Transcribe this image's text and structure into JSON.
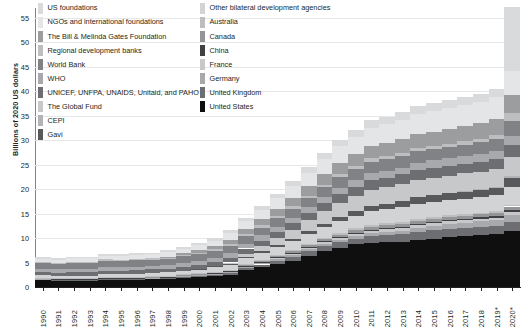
{
  "axis": {
    "ylabel": "Billions of 2020 US dollars",
    "yticks": [
      "0",
      "5",
      "10",
      "15",
      "20",
      "25",
      "30",
      "35",
      "40",
      "45",
      "50",
      "55"
    ],
    "xticks": [
      "1990",
      "1991",
      "1992",
      "1993",
      "1994",
      "1995",
      "1996",
      "1997",
      "1998",
      "1999",
      "2000",
      "2001",
      "2002",
      "2003",
      "2004",
      "2005",
      "2006",
      "2007",
      "2008",
      "2009",
      "2010",
      "2011",
      "2012",
      "2013",
      "2014",
      "2015",
      "2016",
      "2017",
      "2018",
      "2019*",
      "2020*"
    ]
  },
  "legend": {
    "left": [
      {
        "label": "US foundations",
        "color": "#d9dadb"
      },
      {
        "label": "NGOs and international foundations",
        "color": "#e4e5e6"
      },
      {
        "label": "The Bill & Melinda Gates Foundation",
        "color": "#9b9d9f"
      },
      {
        "label": "Regional development banks",
        "color": "#bcbec0"
      },
      {
        "label": "World Bank",
        "color": "#808285"
      },
      {
        "label": "WHO",
        "color": "#a7a9ac"
      },
      {
        "label": "UNICEF, UNFPA, UNAIDS, Unitaid, and PAHO",
        "color": "#6d6e71"
      },
      {
        "label": "The Global Fund",
        "color": "#c7c8ca"
      },
      {
        "label": "CEPI",
        "color": "#b1b3b6"
      },
      {
        "label": "Gavi",
        "color": "#58595b"
      }
    ],
    "right": [
      {
        "label": "Other bilateral development agencies",
        "color": "#d1d3d4"
      },
      {
        "label": "Australia",
        "color": "#bcbec0"
      },
      {
        "label": "Canada",
        "color": "#939598"
      },
      {
        "label": "China",
        "color": "#414042"
      },
      {
        "label": "France",
        "color": "#c7c8ca"
      },
      {
        "label": "Germany",
        "color": "#a7a9ac"
      },
      {
        "label": "United Kingdom",
        "color": "#6d6e71"
      },
      {
        "label": "United States",
        "color": "#0f0f0f"
      }
    ]
  },
  "chart_data": {
    "type": "area",
    "subtype": "stacked-column",
    "title": "",
    "xlabel": "",
    "ylabel": "Billions of 2020 US dollars",
    "ylim": [
      0,
      57
    ],
    "grid": true,
    "legend_position": "top",
    "categories": [
      "1990",
      "1991",
      "1992",
      "1993",
      "1994",
      "1995",
      "1996",
      "1997",
      "1998",
      "1999",
      "2000",
      "2001",
      "2002",
      "2003",
      "2004",
      "2005",
      "2006",
      "2007",
      "2008",
      "2009",
      "2010",
      "2011",
      "2012",
      "2013",
      "2014",
      "2015",
      "2016",
      "2017",
      "2018",
      "2019*",
      "2020*"
    ],
    "series": [
      {
        "name": "United States",
        "color": "#0f0f0f",
        "values": [
          1.4,
          1.3,
          1.3,
          1.3,
          1.5,
          1.5,
          1.5,
          1.6,
          1.6,
          1.8,
          2.0,
          2.2,
          2.5,
          3.4,
          4.0,
          4.7,
          5.4,
          6.4,
          7.3,
          8.0,
          8.7,
          9.0,
          9.1,
          9.2,
          9.6,
          9.9,
          10.2,
          10.4,
          10.6,
          10.8,
          11.5
        ]
      },
      {
        "name": "United Kingdom",
        "color": "#6d6e71",
        "values": [
          0.15,
          0.15,
          0.15,
          0.15,
          0.2,
          0.2,
          0.2,
          0.2,
          0.25,
          0.3,
          0.3,
          0.35,
          0.4,
          0.5,
          0.6,
          0.7,
          0.8,
          0.9,
          1.0,
          1.1,
          1.2,
          1.4,
          1.5,
          1.6,
          1.7,
          1.7,
          1.7,
          1.6,
          1.6,
          1.6,
          1.7
        ]
      },
      {
        "name": "Germany",
        "color": "#a7a9ac",
        "values": [
          0.1,
          0.1,
          0.1,
          0.1,
          0.1,
          0.1,
          0.12,
          0.12,
          0.12,
          0.15,
          0.15,
          0.15,
          0.18,
          0.2,
          0.25,
          0.3,
          0.35,
          0.4,
          0.45,
          0.5,
          0.55,
          0.6,
          0.65,
          0.7,
          0.8,
          0.9,
          1.0,
          1.1,
          1.2,
          1.3,
          1.6
        ]
      },
      {
        "name": "France",
        "color": "#c7c8ca",
        "values": [
          0.1,
          0.1,
          0.1,
          0.1,
          0.1,
          0.1,
          0.1,
          0.1,
          0.1,
          0.12,
          0.12,
          0.15,
          0.18,
          0.2,
          0.25,
          0.3,
          0.35,
          0.4,
          0.45,
          0.5,
          0.5,
          0.55,
          0.55,
          0.55,
          0.55,
          0.5,
          0.5,
          0.5,
          0.5,
          0.5,
          0.55
        ]
      },
      {
        "name": "China",
        "color": "#414042",
        "values": [
          0.02,
          0.02,
          0.02,
          0.02,
          0.02,
          0.02,
          0.02,
          0.02,
          0.03,
          0.03,
          0.03,
          0.04,
          0.04,
          0.05,
          0.06,
          0.07,
          0.08,
          0.09,
          0.1,
          0.12,
          0.14,
          0.16,
          0.18,
          0.2,
          0.22,
          0.25,
          0.28,
          0.3,
          0.32,
          0.35,
          0.4
        ]
      },
      {
        "name": "Canada",
        "color": "#939598",
        "values": [
          0.08,
          0.08,
          0.08,
          0.08,
          0.09,
          0.09,
          0.09,
          0.1,
          0.1,
          0.12,
          0.12,
          0.14,
          0.16,
          0.2,
          0.25,
          0.3,
          0.35,
          0.4,
          0.45,
          0.5,
          0.55,
          0.6,
          0.6,
          0.6,
          0.6,
          0.6,
          0.6,
          0.6,
          0.6,
          0.6,
          0.7
        ]
      },
      {
        "name": "Australia",
        "color": "#bcbec0",
        "values": [
          0.05,
          0.05,
          0.05,
          0.05,
          0.05,
          0.06,
          0.06,
          0.06,
          0.07,
          0.07,
          0.08,
          0.09,
          0.1,
          0.12,
          0.14,
          0.16,
          0.18,
          0.2,
          0.25,
          0.3,
          0.35,
          0.4,
          0.42,
          0.45,
          0.45,
          0.42,
          0.4,
          0.38,
          0.36,
          0.35,
          0.4
        ]
      },
      {
        "name": "Other bilateral development agencies",
        "color": "#d1d3d4",
        "values": [
          0.5,
          0.5,
          0.55,
          0.55,
          0.6,
          0.6,
          0.65,
          0.65,
          0.7,
          0.75,
          0.8,
          0.9,
          1.0,
          1.2,
          1.4,
          1.6,
          1.8,
          2.0,
          2.2,
          2.4,
          2.6,
          2.8,
          2.9,
          3.0,
          3.1,
          3.1,
          3.1,
          3.2,
          3.2,
          3.3,
          3.6
        ]
      },
      {
        "name": "Gavi",
        "color": "#58595b",
        "values": [
          0,
          0,
          0,
          0,
          0,
          0,
          0,
          0,
          0,
          0,
          0.1,
          0.2,
          0.25,
          0.3,
          0.35,
          0.4,
          0.5,
          0.6,
          0.7,
          0.8,
          0.9,
          1.0,
          1.1,
          1.2,
          1.3,
          1.4,
          1.4,
          1.5,
          1.5,
          1.6,
          1.8
        ]
      },
      {
        "name": "CEPI",
        "color": "#b1b3b6",
        "values": [
          0,
          0,
          0,
          0,
          0,
          0,
          0,
          0,
          0,
          0,
          0,
          0,
          0,
          0,
          0,
          0,
          0,
          0,
          0,
          0,
          0,
          0,
          0,
          0,
          0,
          0,
          0,
          0.05,
          0.08,
          0.1,
          0.5
        ]
      },
      {
        "name": "The Global Fund",
        "color": "#c7c8ca",
        "values": [
          0,
          0,
          0,
          0,
          0,
          0,
          0,
          0,
          0,
          0,
          0,
          0,
          0.2,
          0.6,
          1.0,
          1.4,
          1.8,
          2.2,
          2.6,
          3.0,
          3.2,
          3.4,
          3.4,
          3.5,
          3.6,
          3.6,
          3.6,
          3.6,
          3.6,
          3.6,
          3.8
        ]
      },
      {
        "name": "UNICEF, UNFPA, UNAIDS, Unitaid, and PAHO",
        "color": "#6d6e71",
        "values": [
          0.6,
          0.6,
          0.65,
          0.65,
          0.7,
          0.7,
          0.7,
          0.75,
          0.75,
          0.8,
          0.85,
          0.9,
          1.0,
          1.1,
          1.2,
          1.3,
          1.4,
          1.5,
          1.6,
          1.7,
          1.8,
          1.9,
          1.9,
          2.0,
          2.0,
          2.0,
          2.0,
          2.0,
          2.0,
          2.1,
          2.4
        ]
      },
      {
        "name": "WHO",
        "color": "#a7a9ac",
        "values": [
          0.7,
          0.7,
          0.7,
          0.7,
          0.75,
          0.75,
          0.75,
          0.75,
          0.8,
          0.8,
          0.85,
          0.9,
          0.95,
          1.0,
          1.05,
          1.1,
          1.15,
          1.2,
          1.25,
          1.3,
          1.35,
          1.4,
          1.4,
          1.4,
          1.45,
          1.5,
          1.5,
          1.55,
          1.6,
          1.6,
          2.0
        ]
      },
      {
        "name": "World Bank",
        "color": "#808285",
        "values": [
          1.2,
          1.1,
          1.2,
          1.2,
          1.3,
          1.2,
          1.3,
          1.2,
          1.3,
          1.3,
          1.3,
          1.3,
          1.4,
          1.5,
          1.6,
          1.7,
          1.8,
          1.9,
          2.0,
          2.2,
          2.3,
          2.4,
          2.4,
          2.4,
          2.4,
          2.3,
          2.3,
          2.3,
          2.4,
          2.5,
          3.0
        ]
      },
      {
        "name": "Regional development banks",
        "color": "#bcbec0",
        "values": [
          0.3,
          0.3,
          0.3,
          0.3,
          0.3,
          0.3,
          0.3,
          0.3,
          0.3,
          0.35,
          0.35,
          0.35,
          0.4,
          0.4,
          0.45,
          0.45,
          0.5,
          0.5,
          0.55,
          0.6,
          0.6,
          0.65,
          0.65,
          0.65,
          0.7,
          0.7,
          0.7,
          0.7,
          0.75,
          0.8,
          1.6
        ]
      },
      {
        "name": "The Bill & Melinda Gates Foundation",
        "color": "#9b9d9f",
        "values": [
          0,
          0,
          0,
          0,
          0,
          0,
          0,
          0,
          0.1,
          0.3,
          0.5,
          0.7,
          0.9,
          1.1,
          1.3,
          1.5,
          1.7,
          1.9,
          2.1,
          2.3,
          2.4,
          2.5,
          2.6,
          2.7,
          2.8,
          2.9,
          3.0,
          3.1,
          3.2,
          3.3,
          3.6
        ]
      },
      {
        "name": "NGOs and international foundations",
        "color": "#e4e5e6",
        "values": [
          0.6,
          0.6,
          0.65,
          0.65,
          0.7,
          0.7,
          0.75,
          0.8,
          0.85,
          0.9,
          1.0,
          1.1,
          1.3,
          1.6,
          1.9,
          2.2,
          2.5,
          2.8,
          3.1,
          3.4,
          3.6,
          3.8,
          3.9,
          4.0,
          4.1,
          4.2,
          4.2,
          4.3,
          4.3,
          4.4,
          5.0
        ]
      },
      {
        "name": "US foundations",
        "color": "#d9dadb",
        "values": [
          0.3,
          0.3,
          0.3,
          0.3,
          0.35,
          0.35,
          0.35,
          0.4,
          0.4,
          0.45,
          0.5,
          0.55,
          0.6,
          0.7,
          0.8,
          0.9,
          1.0,
          1.1,
          1.2,
          1.3,
          1.4,
          1.5,
          1.5,
          1.55,
          1.6,
          1.6,
          1.65,
          1.7,
          1.7,
          1.75,
          13.0
        ]
      }
    ],
    "totals": [
      6.1,
      5.9,
      6.2,
      6.2,
      6.8,
      6.7,
      7.1,
      7.5,
      8.1,
      9.2,
      10.1,
      11.1,
      12.8,
      15.5,
      18.0,
      20.2,
      22.4,
      25.0,
      27.8,
      30.5,
      32.7,
      34.6,
      35.2,
      36.1,
      37.4,
      37.6,
      38.2,
      39.0,
      39.6,
      40.5,
      55.0
    ]
  }
}
